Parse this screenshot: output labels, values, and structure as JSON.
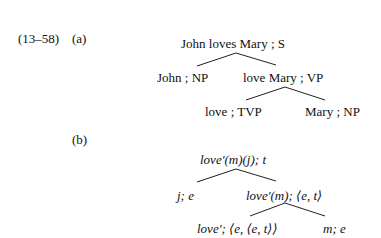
{
  "example": {
    "number": "(13–58)",
    "part_a": {
      "label": "(a)",
      "root": "John loves Mary ; S",
      "left_child": "John ; NP",
      "right_child": "love Mary ; VP",
      "right_left": "love ; TVP",
      "right_right": "Mary ; NP"
    },
    "part_b": {
      "label": "(b)",
      "root": "love′(m)(j); t",
      "left_child": "j; e",
      "right_child": "love′(m); ⟨e, t⟩",
      "right_left": "love′; ⟨e, ⟨e, t⟩⟩",
      "right_right": "m; e"
    }
  }
}
